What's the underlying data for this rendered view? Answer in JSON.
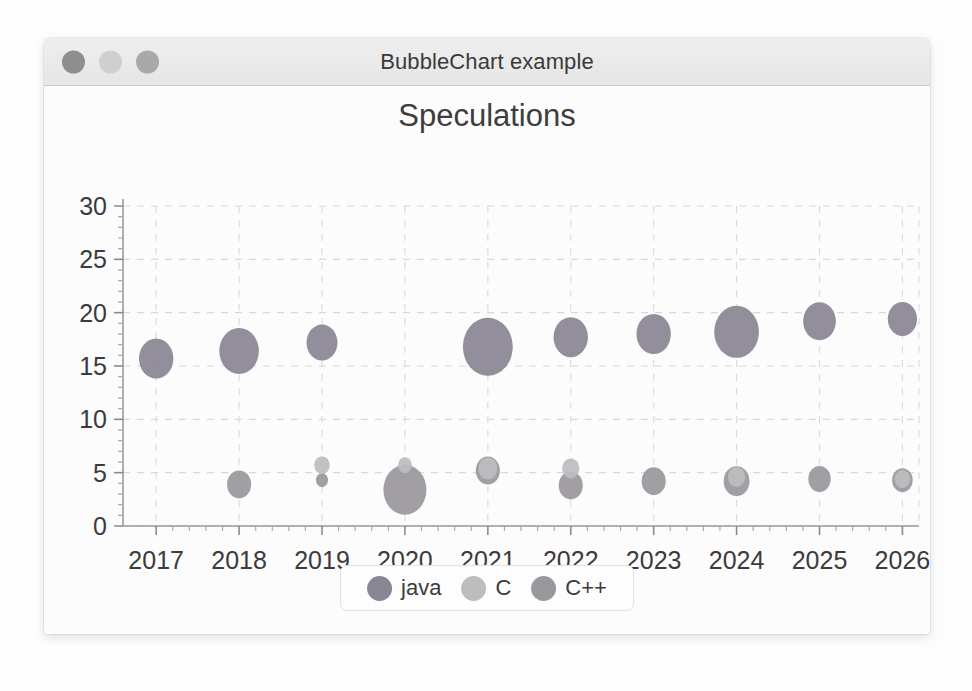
{
  "window": {
    "title": "BubbleChart example",
    "controls": [
      {
        "name": "close",
        "color": "#8e8e8e"
      },
      {
        "name": "minimize",
        "color": "#cfcfcf"
      },
      {
        "name": "maximize",
        "color": "#a9a9a9"
      }
    ]
  },
  "chart_data": {
    "type": "scatter",
    "title": "Speculations",
    "xlabel": "",
    "ylabel": "",
    "xlim": [
      2016.6,
      2026.2
    ],
    "ylim": [
      0,
      30
    ],
    "grid": true,
    "legend_position": "bottom",
    "x_ticks": [
      "2017",
      "2018",
      "2019",
      "2020",
      "2021",
      "2022",
      "2023",
      "2024",
      "2025",
      "2026"
    ],
    "y_ticks": [
      "0",
      "5",
      "10",
      "15",
      "20",
      "25",
      "30"
    ],
    "minor_ticks": true,
    "series": [
      {
        "name": "java",
        "color": "#8a8594",
        "x": [
          2017,
          2018,
          2019,
          2020,
          2021,
          2022,
          2023,
          2024,
          2025,
          2026
        ],
        "y": [
          15.7,
          16.4,
          17.2,
          0,
          16.8,
          17.7,
          18.0,
          18.2,
          19.2,
          19.4
        ],
        "size": [
          20,
          23,
          18,
          0,
          29,
          20,
          20,
          26,
          19,
          17
        ]
      },
      {
        "name": "C",
        "color": "#bdbcbe",
        "x": [
          2019,
          2020,
          2021,
          2022,
          2024,
          2026
        ],
        "y": [
          5.7,
          5.7,
          5.4,
          5.4,
          4.6,
          4.4
        ],
        "size": [
          9,
          8,
          11,
          10,
          10,
          9
        ]
      },
      {
        "name": "C++",
        "color": "#9a979d",
        "x": [
          2018,
          2019,
          2020,
          2021,
          2022,
          2023,
          2024,
          2025,
          2026
        ],
        "y": [
          3.9,
          4.3,
          3.4,
          5.2,
          3.8,
          4.2,
          4.2,
          4.4,
          4.3
        ],
        "size": [
          14,
          7,
          25,
          14,
          14,
          14,
          15,
          13,
          12
        ]
      }
    ]
  },
  "legend": {
    "items": [
      {
        "label": "java",
        "color": "#8a8594"
      },
      {
        "label": "C",
        "color": "#bdbcbe"
      },
      {
        "label": "C++",
        "color": "#9a979d"
      }
    ]
  }
}
